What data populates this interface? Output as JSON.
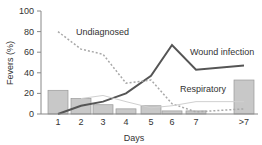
{
  "chart_data": {
    "type": "bar",
    "title": "",
    "xlabel": "Days",
    "ylabel": "Fevers (%)",
    "ylim": [
      0,
      100
    ],
    "yticks": [
      0,
      20,
      40,
      60,
      80,
      100
    ],
    "categories": [
      "1",
      "2",
      "3",
      "4",
      "5",
      "6",
      "7",
      ">7"
    ],
    "grid": false,
    "legend": "inline labels",
    "bars": {
      "name": "All fevers",
      "color": "#c8c8c8",
      "values": [
        23,
        15,
        9,
        5,
        8,
        3,
        3,
        33
      ]
    },
    "series": [
      {
        "name": "Wound infection",
        "type": "line",
        "style": "solid",
        "color": "#555555",
        "values": [
          0,
          8,
          12,
          20,
          37,
          67,
          43,
          47
        ]
      },
      {
        "name": "Undiagnosed",
        "type": "line",
        "style": "dotted",
        "color": "#a8a8a8",
        "values": [
          80,
          63,
          58,
          30,
          33,
          10,
          2,
          5
        ]
      },
      {
        "name": "Respiratory",
        "type": "line",
        "style": "solid-thin",
        "color": "#d0d0d0",
        "values": [
          null,
          15,
          18,
          12,
          6,
          8,
          12,
          12
        ]
      }
    ],
    "annotations": [
      {
        "text": "Undiagnosed"
      },
      {
        "text": "Wound infection"
      },
      {
        "text": "Respiratory"
      }
    ]
  }
}
